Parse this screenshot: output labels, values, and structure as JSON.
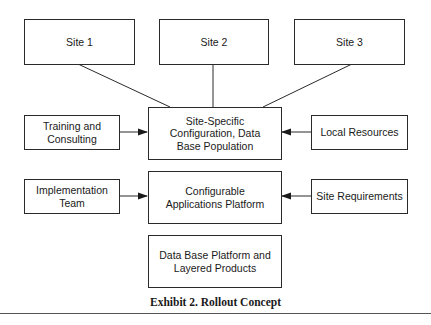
{
  "diagram": {
    "type": "block-diagram",
    "caption": "Exhibit 2. Rollout Concept",
    "colors": {
      "stroke": "#2a2a2a",
      "text": "#1a1a1a",
      "background": "#ffffff",
      "rule": "#555555"
    },
    "nodes": {
      "site1": {
        "label": "Site 1"
      },
      "site2": {
        "label": "Site 2"
      },
      "site3": {
        "label": "Site 3"
      },
      "site_specific": {
        "label": "Site-Specific\nConfiguration, Data\nBase Population"
      },
      "training": {
        "label": "Training and\nConsulting"
      },
      "local_resources": {
        "label": "Local Resources"
      },
      "configurable_platform": {
        "label": "Configurable\nApplications Platform"
      },
      "implementation_team": {
        "label": "Implementation\nTeam"
      },
      "site_requirements": {
        "label": "Site Requirements"
      },
      "database_platform": {
        "label": "Data Base Platform and\nLayered Products"
      }
    },
    "edges": [
      {
        "from": "site1",
        "to": "site_specific",
        "style": "line"
      },
      {
        "from": "site2",
        "to": "site_specific",
        "style": "line"
      },
      {
        "from": "site3",
        "to": "site_specific",
        "style": "line"
      },
      {
        "from": "training",
        "to": "site_specific",
        "style": "arrow"
      },
      {
        "from": "local_resources",
        "to": "site_specific",
        "style": "arrow"
      },
      {
        "from": "implementation_team",
        "to": "configurable_platform",
        "style": "arrow"
      },
      {
        "from": "site_requirements",
        "to": "configurable_platform",
        "style": "arrow"
      }
    ]
  }
}
